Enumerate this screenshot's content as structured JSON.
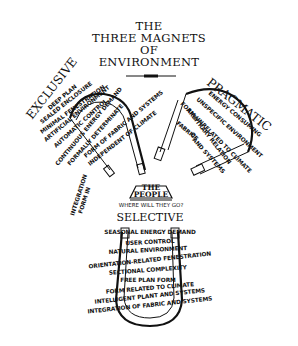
{
  "title": {
    "line1": "THE",
    "line2": "THREE MAGNETS",
    "line3": "OF",
    "line4": "ENVIRONMENT"
  },
  "center": {
    "label_line1": "THE",
    "label_line2": "PEOPLE",
    "question": "WHERE WILL THEY GO?"
  },
  "magnets": {
    "exclusive": {
      "label": "EXCLUSIVE",
      "attributes": [
        "DEEP PLAN",
        "SEALED ENCLOSURE",
        "MINIMAL FENESTRATION",
        "ARTIFICIAL ENVIRONMENT",
        "AUTOMATIC CONTROL",
        "CONTINUOUS ENERGY DEMAND",
        "FORMALLY DETERMINATE",
        "FORM OF FABRIC AND SYSTEMS",
        "INDEPENDENT OF CLIMATE",
        "INTEGRATION",
        "FORM IN"
      ]
    },
    "pragmatic": {
      "label": "PRAGMATIC",
      "attributes": [
        "ENERGY CONSUMING",
        "UNSPECIFIC ENVIRONMENT",
        "FORM UNRELATED TO CLIMATE",
        "ARBITRARY RELATION",
        "OF",
        "FABRIC",
        "AND SYSTEMS"
      ]
    },
    "selective": {
      "label": "SELECTIVE",
      "attributes": [
        "SEASONAL ENERGY DEMAND",
        "USER CONTROL",
        "NATURAL ENVIRONMENT",
        "ORIENTATION-RELATED FENESTRATION",
        "SECTIONAL COMPLEXITY",
        "FREE PLAN FORM",
        "FORM RELATED TO CLIMATE",
        "INTELLIGENT PLANT AND SYSTEMS",
        "INTEGRATION OF FABRIC AND SYSTEMS"
      ]
    }
  },
  "colors": {
    "ink": "#111111",
    "background": "#ffffff"
  }
}
